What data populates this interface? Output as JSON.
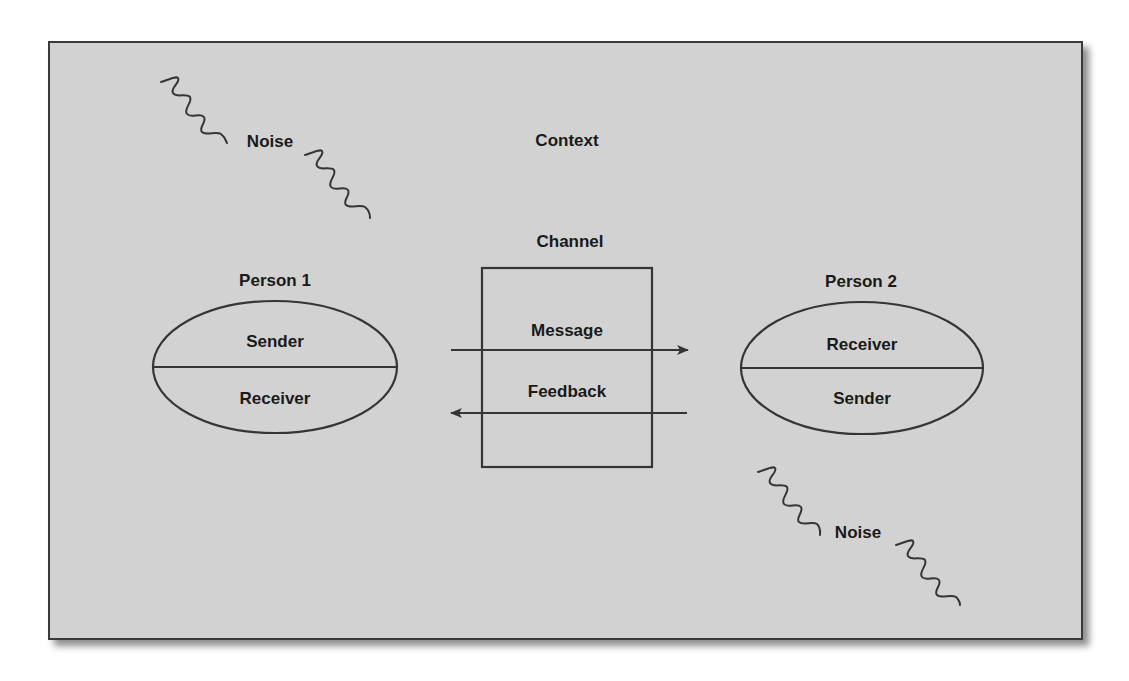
{
  "diagram": {
    "colors": {
      "background": "#d2d2d2",
      "stroke": "#353535",
      "text": "#1a1a1a"
    },
    "context": {
      "label": "Context"
    },
    "channel": {
      "label": "Channel"
    },
    "person1": {
      "title": "Person 1",
      "top_role": "Sender",
      "bottom_role": "Receiver"
    },
    "person2": {
      "title": "Person 2",
      "top_role": "Receiver",
      "bottom_role": "Sender"
    },
    "message": {
      "label": "Message",
      "direction": "Person 1 → Person 2"
    },
    "feedback": {
      "label": "Feedback",
      "direction": "Person 2 → Person 1"
    },
    "noise": [
      {
        "label": "Noise",
        "position": "top-left"
      },
      {
        "label": "Noise",
        "position": "bottom-right"
      }
    ]
  }
}
